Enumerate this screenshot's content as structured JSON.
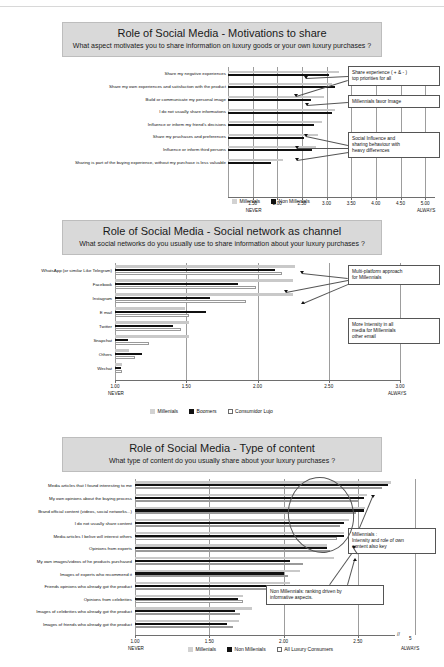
{
  "page": {
    "top_strip_note": ""
  },
  "charts": [
    {
      "id": "motivations",
      "banner_title": "Role of Social Media - Motivations to share",
      "banner_subtitle": "What aspect motivates you to share information on luxury goods or your own luxury purchases ?",
      "axis_low_label": "NEVER",
      "axis_high_label": "ALWAYS",
      "legend": [
        {
          "label": "Millenials",
          "style": "gray"
        },
        {
          "label": "Non Millenials",
          "style": "black"
        }
      ],
      "annotations": [
        "Share experience ( + & - )\ntop priorities for all",
        "Millennials favor Image",
        "Social Influence and\nsharing behaviour with\nheavy differences"
      ],
      "chart_data": {
        "type": "bar",
        "title": "Role of Social Media - Motivations to share",
        "xlabel": "",
        "ylabel": "",
        "xlim": [
          1.0,
          5.2
        ],
        "ticks": [
          "1.50",
          "2.00",
          "2.50",
          "3.00",
          "3.50",
          "4.00",
          "4.50",
          "5.00"
        ],
        "tick_values": [
          1.5,
          2.0,
          2.5,
          3.0,
          3.5,
          4.0,
          4.5,
          5.0
        ],
        "grid": true,
        "legend_position": "bottom",
        "categories": [
          "Share my negative experiences",
          "Share my own experiences and satisfaction with the product",
          "Build or communicate my personal image",
          "I do not usually share informations",
          "Influence or inform my friend's decisions",
          "Share my pruchases and preferences",
          "Influence or inform third persons",
          "Sharing is part of the buying experience, without my purchase is less valuable"
        ],
        "series": [
          {
            "name": "Millenials",
            "style": "gray",
            "values": [
              3.25,
              3.12,
              2.95,
              3.18,
              2.9,
              2.82,
              2.78,
              2.12
            ]
          },
          {
            "name": "Non Millenials",
            "style": "black",
            "values": [
              3.05,
              3.18,
              2.68,
              3.1,
              2.75,
              2.55,
              2.7,
              1.88
            ]
          }
        ]
      }
    },
    {
      "id": "social-network",
      "banner_title": "Role of Social Media - Social network as channel",
      "banner_subtitle": "What social networks do you usually use to share information about your luxury purchases ?",
      "axis_low_label": "NEVER",
      "axis_high_label": "ALWAYS",
      "legend": [
        {
          "label": "Millenials",
          "style": "gray"
        },
        {
          "label": "Boomers",
          "style": "black"
        },
        {
          "label": "Consumidor Lujo",
          "style": "white"
        }
      ],
      "annotations": [
        "Multi-platform approach\nfor Millennials",
        "More Intensity in all\nmedia for Millennials\nother email"
      ],
      "chart_data": {
        "type": "bar",
        "title": "Role of Social Media - Social network as channel",
        "xlabel": "",
        "ylabel": "",
        "xlim": [
          1.0,
          3.0
        ],
        "ticks": [
          "1.00",
          "1.50",
          "2.00",
          "2.50",
          "3.00"
        ],
        "tick_values": [
          1.0,
          1.5,
          2.0,
          2.5,
          3.0
        ],
        "grid": true,
        "legend_position": "bottom",
        "categories": [
          "WhatsApp (or similar Like Telegram)",
          "Facebook",
          "Instagram",
          "E mail",
          "Twitter",
          "Snapchat",
          "Others",
          "Wechat"
        ],
        "series": [
          {
            "name": "Millenials",
            "style": "gray",
            "values": [
              2.26,
              2.25,
              2.25,
              1.49,
              1.52,
              1.52,
              1.1,
              1.05
            ]
          },
          {
            "name": "Boomers",
            "style": "black",
            "values": [
              2.12,
              1.86,
              1.67,
              1.64,
              1.41,
              1.09,
              1.19,
              1.04
            ]
          },
          {
            "name": "Consumidor Lujo",
            "style": "white",
            "values": [
              2.17,
              1.99,
              1.92,
              1.52,
              1.46,
              1.24,
              1.14,
              1.05
            ]
          }
        ]
      }
    },
    {
      "id": "type-of-content",
      "banner_title": "Role of Social Media - Type of content",
      "banner_subtitle": "What type of content do you usually share about your luxury purchases ?",
      "axis_low_label": "NEVER",
      "axis_high_label": "ALWAYS",
      "axis_extra_tick": "5",
      "legend": [
        {
          "label": "Millenials",
          "style": "gray"
        },
        {
          "label": "Non Millenials",
          "style": "black"
        },
        {
          "label": "All Luxury Consumers",
          "style": "white"
        }
      ],
      "annotations": [
        "Millennials :\nIntensity and role of own\ncontent also key",
        "Non Millennials: ranking driven by\ninformative aspects."
      ],
      "chart_data": {
        "type": "bar",
        "title": "Role of Social Media - Type of content",
        "xlabel": "",
        "ylabel": "",
        "xlim": [
          1.0,
          2.75
        ],
        "ticks": [
          "1.00",
          "1.50",
          "2.00",
          "2.50"
        ],
        "tick_values": [
          1.0,
          1.5,
          2.0,
          2.5
        ],
        "grid": true,
        "legend_position": "bottom",
        "categories": [
          "Media articles that I found interesting to me",
          "My own opinions about the buying process",
          "Brand official content (videos, social networks...)",
          "I do not usually share content",
          "Media articles I belive will interest others",
          "Opinions from experts",
          "My own images/videos of he products purchased",
          "Images of experts who recommend it",
          "Friends opinions who already got the product",
          "Opinions from celebrities",
          "Images of celebrities who already got the product",
          "Images of friends who already got the product"
        ],
        "series": [
          {
            "name": "Millenials",
            "style": "gray",
            "values": [
              2.72,
              2.56,
              2.55,
              2.44,
              2.41,
              2.29,
              2.34,
              2.11,
              2.04,
              1.73,
              1.79,
              1.7
            ]
          },
          {
            "name": "Non Millenials",
            "style": "black",
            "values": [
              2.7,
              2.54,
              2.54,
              2.41,
              2.41,
              2.29,
              2.04,
              2.0,
              1.97,
              1.69,
              1.67,
              1.62
            ]
          },
          {
            "name": "All Luxury Consumers",
            "style": "white",
            "values": [
              2.66,
              2.5,
              2.49,
              2.38,
              2.36,
              2.31,
              2.13,
              2.03,
              1.99,
              1.73,
              1.71,
              1.66
            ]
          }
        ]
      }
    }
  ]
}
